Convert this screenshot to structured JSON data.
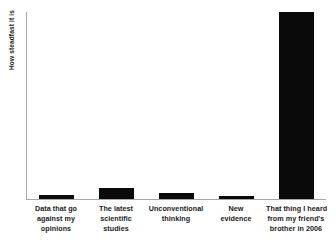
{
  "chart_data": {
    "type": "bar",
    "title": "",
    "xlabel": "",
    "ylabel": "How steadfast it is",
    "grid": false,
    "legend": null,
    "ylim": [
      0,
      100
    ],
    "y_tick_labels": [],
    "categories": [
      "Data that go against my opinions",
      "The latest scientific studies",
      "Unconventional thinking",
      "New evidence",
      "That thing I heard from my friend's brother in 2006"
    ],
    "category_lines": [
      [
        "Data that go",
        "against my",
        "opinions"
      ],
      [
        "The latest",
        "scientific",
        "studies"
      ],
      [
        "Unconventional",
        "thinking"
      ],
      [
        "New",
        "evidence"
      ],
      [
        "That thing I heard",
        "from my friend's",
        "brother in 2006"
      ]
    ],
    "values": [
      2,
      6,
      3,
      1.5,
      100
    ],
    "bar_color": "#0a0a0a",
    "background_color": "#ffffff",
    "axis_color": "#a8a8a8"
  }
}
